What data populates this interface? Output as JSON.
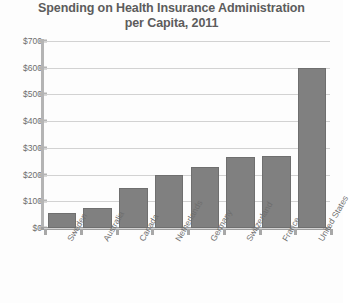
{
  "chart_data": {
    "type": "bar",
    "title": "Spending on Health Insurance Administration per Capita, 2011",
    "title_line1": "Spending on Health Insurance Administration",
    "title_line2": "per Capita, 2011",
    "xlabel": "",
    "ylabel": "",
    "ylim": [
      0,
      700
    ],
    "ytick_step": 100,
    "grid": true,
    "legend": false,
    "bar_color": "#808080",
    "gridline_color": "#d2d2d2",
    "text_color": "#6e6e6e",
    "title_color": "#5c5c5c",
    "categories": [
      "Sweden",
      "Australia",
      "Canada",
      "Netherlands",
      "Germany",
      "Switzerland",
      "France",
      "United States"
    ],
    "values": [
      55,
      75,
      150,
      200,
      230,
      265,
      270,
      600
    ],
    "ytick_labels": [
      "$700",
      "$600",
      "$500",
      "$400",
      "$300",
      "$200",
      "$100",
      "$0"
    ],
    "ytick_values": [
      700,
      600,
      500,
      400,
      300,
      200,
      100,
      0
    ]
  }
}
